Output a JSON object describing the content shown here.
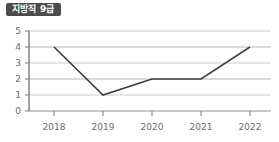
{
  "title": {
    "label": "지방직 9급"
  },
  "chart_data": {
    "type": "line",
    "title": "지방직 9급",
    "xlabel": "",
    "ylabel": "",
    "categories": [
      "2018",
      "2019",
      "2020",
      "2021",
      "2022"
    ],
    "values": [
      4,
      1,
      2,
      2,
      4
    ],
    "series": [
      {
        "name": "지방직 9급",
        "values": [
          4,
          1,
          2,
          2,
          4
        ]
      }
    ],
    "ylim": [
      0,
      5
    ],
    "yticks": [
      "0",
      "1",
      "2",
      "3",
      "4",
      "5"
    ],
    "xticks": [
      "2018",
      "2019",
      "2020",
      "2021",
      "2022"
    ],
    "grid": true,
    "legend": false,
    "markers": false,
    "colors": {
      "line": "#3c3c3c",
      "grid": "#c9c9c9",
      "axis": "#6b6b6b",
      "tick_text": "#6b6b6b",
      "badge_bg": "#4c4c4c",
      "badge_text": "#ffffff"
    }
  }
}
